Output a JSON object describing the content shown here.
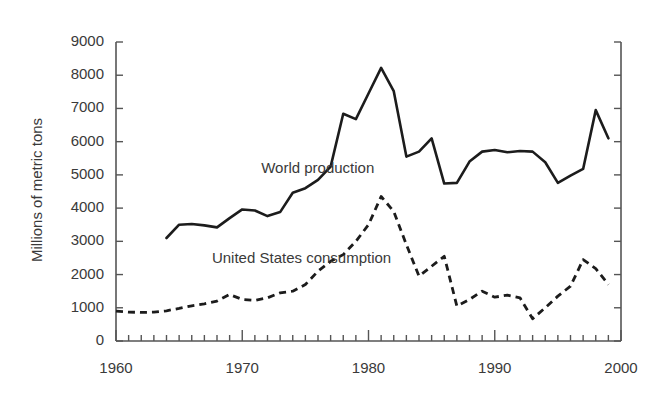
{
  "chart_data": {
    "type": "line",
    "title": "",
    "xlabel": "",
    "ylabel": "Millions of metric tons",
    "xlim": [
      1960,
      2000
    ],
    "ylim": [
      0,
      9000
    ],
    "grid": false,
    "legend_position": "inline-annotations",
    "xticks": [
      1960,
      1970,
      1980,
      1990,
      2000
    ],
    "xtick_labels": [
      "1960",
      "1970",
      "1980",
      "1990",
      "2000"
    ],
    "x_minor_tick_interval": 1,
    "yticks": [
      0,
      1000,
      2000,
      3000,
      4000,
      5000,
      6000,
      7000,
      8000,
      9000
    ],
    "ytick_labels": [
      "0",
      "1000",
      "2000",
      "3000",
      "4000",
      "5000",
      "6000",
      "7000",
      "8000",
      "9000"
    ],
    "series": [
      {
        "name": "World production",
        "style": "solid",
        "color": "#1c1c1c",
        "label_x": 1971.5,
        "label_y": 5050,
        "x": [
          1964,
          1965,
          1966,
          1967,
          1968,
          1969,
          1970,
          1971,
          1972,
          1973,
          1974,
          1975,
          1976,
          1977,
          1978,
          1979,
          1980,
          1981,
          1982,
          1983,
          1984,
          1985,
          1986,
          1987,
          1988,
          1989,
          1990,
          1991,
          1992,
          1993,
          1994,
          1995,
          1996,
          1997,
          1998,
          1999
        ],
        "values": [
          3100,
          3500,
          3520,
          3480,
          3420,
          3700,
          3960,
          3930,
          3760,
          3880,
          4460,
          4600,
          4850,
          5250,
          6840,
          6680,
          7450,
          8220,
          7520,
          5550,
          5700,
          6100,
          4740,
          4760,
          5400,
          5700,
          5750,
          5680,
          5720,
          5700,
          5380,
          4760,
          4980,
          5180,
          6950,
          6100
        ]
      },
      {
        "name": "United States consumption",
        "style": "dashed",
        "color": "#1c1c1c",
        "label_x": 1967.6,
        "label_y": 2360,
        "x": [
          1960,
          1961,
          1962,
          1963,
          1964,
          1965,
          1966,
          1967,
          1968,
          1969,
          1970,
          1971,
          1972,
          1973,
          1974,
          1975,
          1976,
          1977,
          1978,
          1979,
          1980,
          1981,
          1982,
          1983,
          1984,
          1985,
          1986,
          1987,
          1988,
          1989,
          1990,
          1991,
          1992,
          1993,
          1994,
          1995,
          1996,
          1997,
          1998,
          1999
        ],
        "values": [
          900,
          870,
          860,
          870,
          910,
          980,
          1060,
          1120,
          1200,
          1400,
          1250,
          1220,
          1300,
          1450,
          1500,
          1700,
          2100,
          2400,
          2600,
          3000,
          3500,
          4350,
          3900,
          2900,
          1950,
          2250,
          2550,
          1050,
          1250,
          1500,
          1320,
          1380,
          1300,
          670,
          1000,
          1350,
          1650,
          2450,
          2180,
          1700
        ]
      }
    ]
  }
}
